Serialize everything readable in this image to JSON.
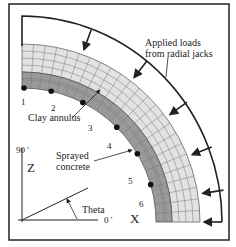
{
  "diagram": {
    "labels": {
      "applied_loads": [
        "Applied loads",
        "from radial jacks"
      ],
      "clay_annulus": "Clay annulus",
      "sprayed_concrete": [
        "Sprayed",
        "concrete"
      ],
      "theta": "Theta",
      "axis_z": "Z",
      "axis_x": "X",
      "angle_90": "90 '",
      "angle_0": "0 '"
    },
    "points": [
      "1",
      "2",
      "3",
      "4",
      "5",
      "6"
    ],
    "colors": {
      "frame": "#222222",
      "clay": "#9a9a9a",
      "concrete": "#e2e2e2",
      "grid": "#666666"
    }
  }
}
